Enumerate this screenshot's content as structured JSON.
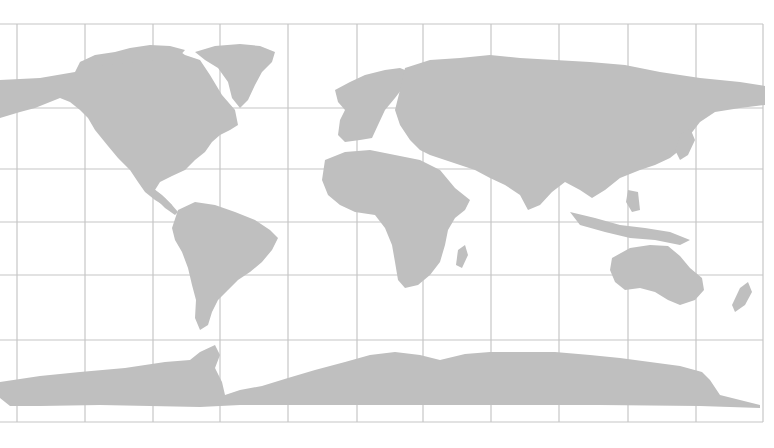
{
  "map": {
    "projection": "equirectangular world map",
    "colors": {
      "background": "#ffffff",
      "land": "#bfbfbf",
      "gridlines": "#c6c6c6"
    },
    "graticule": {
      "vertical_x": [
        17,
        85,
        153,
        220,
        288,
        357,
        423,
        491,
        559,
        628,
        696,
        763
      ],
      "horizontal_y": [
        24,
        108,
        169,
        222,
        275,
        340,
        422
      ]
    },
    "regions": [
      "North America",
      "Greenland",
      "South America",
      "Europe",
      "Africa",
      "Asia",
      "Australia",
      "New Zealand",
      "Antarctica",
      "Madagascar"
    ]
  }
}
